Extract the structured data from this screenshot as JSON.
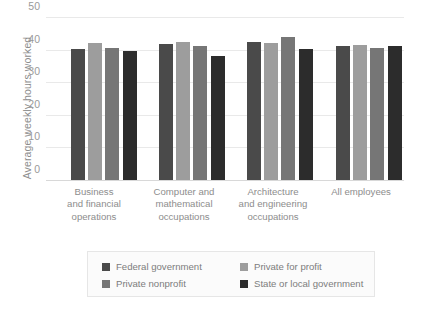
{
  "chart_data": {
    "type": "bar",
    "title": "",
    "xlabel": "",
    "ylabel": "Average weekly hours worked",
    "ylim": [
      0,
      50
    ],
    "yticks": [
      0,
      10,
      20,
      30,
      40,
      50
    ],
    "grid": true,
    "legend_position": "bottom",
    "categories": [
      "Business and financial operations",
      "Computer and mathematical occupations",
      "Architecture and engineering occupations",
      "All employees"
    ],
    "category_lines": [
      [
        "Business",
        "and financial",
        "operations"
      ],
      [
        "Computer and",
        "mathematical",
        "occupations"
      ],
      [
        "Architecture",
        "and engineering",
        "occupations"
      ],
      [
        "All employees"
      ]
    ],
    "series": [
      {
        "name": "Federal government",
        "color": "#4a4a4a",
        "values": [
          40.5,
          42.0,
          42.6,
          41.5
        ]
      },
      {
        "name": "Private for profit",
        "color": "#9d9d9d",
        "values": [
          42.4,
          42.5,
          42.4,
          41.7
        ]
      },
      {
        "name": "Private nonprofit",
        "color": "#767676",
        "values": [
          40.8,
          41.5,
          44.2,
          40.7
        ]
      },
      {
        "name": "State or local government",
        "color": "#2c2c2c",
        "values": [
          40.0,
          38.2,
          40.4,
          41.4
        ]
      }
    ]
  },
  "legend": {
    "items": [
      {
        "label": "Federal government",
        "color": "#4a4a4a"
      },
      {
        "label": "Private for profit",
        "color": "#9d9d9d"
      },
      {
        "label": "Private nonprofit",
        "color": "#767676"
      },
      {
        "label": "State or local government",
        "color": "#2c2c2c"
      }
    ]
  }
}
